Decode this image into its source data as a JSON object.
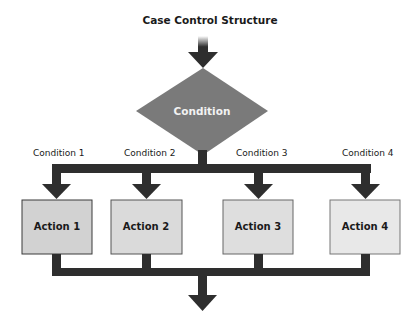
{
  "diagram": {
    "title": "Case Control Structure",
    "condition": {
      "label": "Condition",
      "color": "#7a7a7a"
    },
    "branches": [
      {
        "condition_label": "Condition 1",
        "action_label": "Action 1",
        "box_color": "#d2d2d2"
      },
      {
        "condition_label": "Condition 2",
        "action_label": "Action 2",
        "box_color": "#dadada"
      },
      {
        "condition_label": "Condition 3",
        "action_label": "Action 3",
        "box_color": "#dedede"
      },
      {
        "condition_label": "Condition 4",
        "action_label": "Action 4",
        "box_color": "#e8e8e8"
      }
    ],
    "connector_color": "#2e2e2e"
  }
}
